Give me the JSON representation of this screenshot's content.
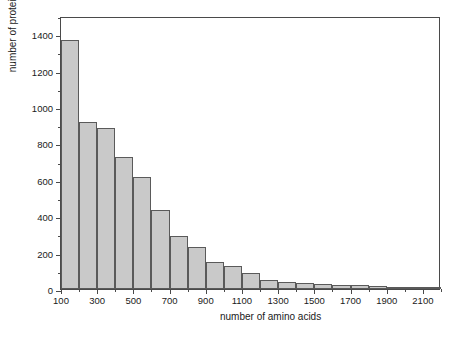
{
  "chart_data": {
    "type": "bar",
    "title": "",
    "subtitle": "",
    "xlabel": "number of amino acids",
    "ylabel": "number of proteins",
    "xlim": [
      100,
      2200
    ],
    "ylim": [
      0,
      1500
    ],
    "grid": false,
    "legend": null,
    "bin_width": 100,
    "bar_fill_color": "#c9c9c9",
    "bar_edge_color": "#5a5a5a",
    "axis_color": "#4a4a4a",
    "background_color": "#ffffff",
    "categories": [
      "100-200",
      "200-300",
      "300-400",
      "400-500",
      "500-600",
      "600-700",
      "700-800",
      "800-900",
      "900-1000",
      "1000-1100",
      "1100-1200",
      "1200-1300",
      "1300-1400",
      "1400-1500",
      "1500-1600",
      "1600-1700",
      "1700-1800",
      "1800-1900",
      "1900-2000",
      "2000-2100",
      "2100-2200"
    ],
    "bin_starts": [
      100,
      200,
      300,
      400,
      500,
      600,
      700,
      800,
      900,
      1000,
      1100,
      1200,
      1300,
      1400,
      1500,
      1600,
      1700,
      1800,
      1900,
      2000,
      2100
    ],
    "values": [
      1370,
      915,
      885,
      725,
      615,
      435,
      293,
      233,
      150,
      127,
      88,
      52,
      38,
      35,
      25,
      22,
      20,
      14,
      10,
      6,
      3
    ],
    "x_ticks_major": [
      100,
      300,
      500,
      700,
      900,
      1100,
      1300,
      1500,
      1700,
      1900,
      2100
    ],
    "x_tick_labels": [
      "100",
      "300",
      "500",
      "700",
      "900",
      "1100",
      "1300",
      "1500",
      "1700",
      "1900",
      "2100"
    ],
    "x_ticks_minor": [
      200,
      400,
      600,
      800,
      1000,
      1200,
      1400,
      1600,
      1800,
      2000,
      2200
    ],
    "y_ticks_major": [
      0,
      200,
      400,
      600,
      800,
      1000,
      1200,
      1400
    ],
    "y_tick_labels": [
      "0",
      "200",
      "400",
      "600",
      "800",
      "1000",
      "1200",
      "1400"
    ],
    "y_ticks_minor": [
      100,
      300,
      500,
      700,
      900,
      1100,
      1300,
      1500
    ]
  }
}
